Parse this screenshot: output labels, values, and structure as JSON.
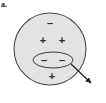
{
  "figure": {
    "panel_label": "a.",
    "colors": {
      "background": "#ffffff",
      "body_fill": "#e3e3e3",
      "body_stroke": "#4a4a4a",
      "inner_fill": "#e3e3e3",
      "inner_stroke": "#3d3d3d",
      "arrow": "#1f1f1f",
      "symbol": "#2b2b2b"
    },
    "body": {
      "name": "charged-sphere",
      "cx": 50,
      "cy": 49,
      "r": 36
    },
    "inner_region": {
      "name": "highlighted-region",
      "cx": 53,
      "cy": 60,
      "rx": 20,
      "ry": 8
    },
    "charges": [
      {
        "symbol": "–",
        "x": 50,
        "y": 24,
        "sign": "negative",
        "location": "top"
      },
      {
        "symbol": "+",
        "x": 43,
        "y": 41,
        "sign": "positive",
        "location": "middle-left"
      },
      {
        "symbol": "+",
        "x": 62,
        "y": 41,
        "sign": "positive",
        "location": "middle-right"
      },
      {
        "symbol": "–",
        "x": 44,
        "y": 61,
        "sign": "negative",
        "location": "inner-left"
      },
      {
        "symbol": "–",
        "x": 62,
        "y": 61,
        "sign": "negative",
        "location": "inner-right"
      },
      {
        "symbol": "+",
        "x": 52,
        "y": 77,
        "sign": "positive",
        "location": "bottom"
      }
    ],
    "callout_arrow": {
      "name": "callout-arrow",
      "x1": 71,
      "y1": 64,
      "x2": 92,
      "y2": 84
    }
  }
}
